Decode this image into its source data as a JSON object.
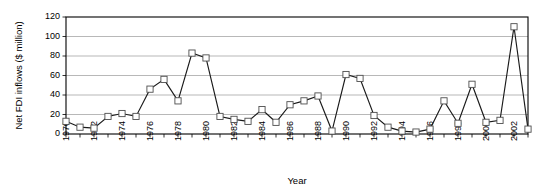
{
  "chart_data": {
    "type": "line",
    "title": "",
    "xlabel": "Year",
    "ylabel": "Net FDI inflows ($ million)",
    "xlim": [
      1970,
      2003
    ],
    "ylim": [
      0,
      120
    ],
    "yticks": [
      0,
      20,
      40,
      60,
      80,
      100,
      120
    ],
    "xticks_labeled": [
      1970,
      1972,
      1974,
      1976,
      1978,
      1980,
      1982,
      1984,
      1986,
      1988,
      1990,
      1992,
      1994,
      1996,
      1998,
      2000,
      2002
    ],
    "grid": "horizontal",
    "legend": "none",
    "marker": "open-square",
    "x": [
      1970,
      1971,
      1972,
      1973,
      1974,
      1975,
      1976,
      1977,
      1978,
      1979,
      1980,
      1981,
      1982,
      1983,
      1984,
      1985,
      1986,
      1987,
      1988,
      1989,
      1990,
      1991,
      1992,
      1993,
      1994,
      1995,
      1996,
      1997,
      1998,
      1999,
      2000,
      2001,
      2002,
      2003
    ],
    "values": [
      13,
      7,
      6,
      18,
      21,
      18,
      46,
      56,
      34,
      83,
      78,
      18,
      15,
      13,
      25,
      12,
      30,
      34,
      39,
      3,
      61,
      57,
      19,
      7,
      3,
      2,
      5,
      34,
      11,
      51,
      12,
      14,
      110,
      5
    ],
    "series": [
      {
        "name": "Net FDI inflows",
        "values": [
          13,
          7,
          6,
          18,
          21,
          18,
          46,
          56,
          34,
          83,
          78,
          18,
          15,
          13,
          25,
          12,
          30,
          34,
          39,
          3,
          61,
          57,
          19,
          7,
          3,
          2,
          5,
          34,
          11,
          51,
          12,
          14,
          110,
          5
        ]
      }
    ]
  },
  "axis": {
    "y_title": "Net FDI inflows ($ million)",
    "x_title": "Year",
    "y_tick_labels": [
      "120",
      "100",
      "80",
      "60",
      "40",
      "20",
      "0"
    ],
    "x_tick_labels": [
      "1970",
      "1972",
      "1974",
      "1976",
      "1978",
      "1980",
      "1982",
      "1984",
      "1986",
      "1988",
      "1990",
      "1992",
      "1994",
      "1996",
      "1998",
      "2000",
      "2002"
    ]
  }
}
